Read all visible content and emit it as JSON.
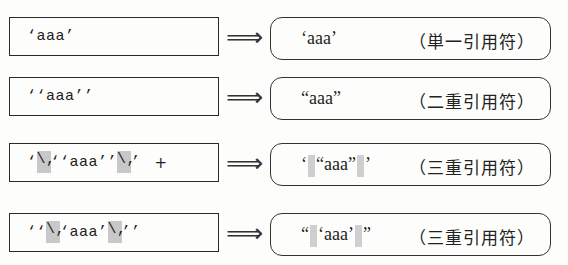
{
  "rows": [
    {
      "source": {
        "parts": [
          "‘aaa’"
        ]
      },
      "arrow": "⟹",
      "result": {
        "parts": [
          "‘aaa’"
        ],
        "label": "（単一引用符）"
      }
    },
    {
      "source": {
        "parts": [
          "‘‘aaa’’"
        ]
      },
      "arrow": "⟹",
      "result": {
        "parts": [
          "“aaa”"
        ],
        "label": "（二重引用符）"
      }
    },
    {
      "source": {
        "p0": "‘",
        "p1": "\\,",
        "p2": "‘‘aaa’’",
        "p3": "\\,",
        "p4": "’",
        "plus": "+"
      },
      "arrow": "⟹",
      "result": {
        "p0": "‘",
        "p1": "“aaa”",
        "p2": "’",
        "label": "（三重引用符）"
      }
    },
    {
      "source": {
        "p0": "‘‘",
        "p1": "\\,",
        "p2": "‘aaa’",
        "p3": "\\,",
        "p4": "’’"
      },
      "arrow": "⟹",
      "result": {
        "p0": "“",
        "p1": "‘aaa’",
        "p2": "”",
        "label": "（三重引用符）"
      }
    }
  ],
  "thin_space_highlight_color": "#c8c8c8"
}
